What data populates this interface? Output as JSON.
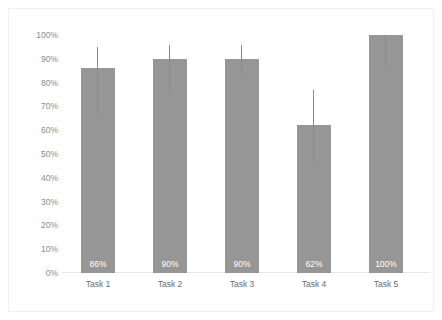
{
  "chart_data": {
    "type": "bar",
    "title": "",
    "subtitle": "",
    "xlabel": "",
    "ylabel": "",
    "categories": [
      "Task 1",
      "Task 2",
      "Task 3",
      "Task 4",
      "Task 5"
    ],
    "values": [
      86,
      90,
      90,
      62,
      100
    ],
    "value_labels": [
      "86%",
      "90%",
      "90%",
      "62%",
      "100%"
    ],
    "error_bars": [
      {
        "low": 67,
        "high": 95
      },
      {
        "low": 75,
        "high": 96
      },
      {
        "low": 84,
        "high": 96
      },
      {
        "low": 47,
        "high": 77
      },
      {
        "low": 87,
        "high": 100
      }
    ],
    "ylim": [
      0,
      100
    ],
    "ytick_values": [
      0,
      10,
      20,
      30,
      40,
      50,
      60,
      70,
      80,
      90,
      100
    ],
    "ytick_labels": [
      "0%",
      "10%",
      "20%",
      "30%",
      "40%",
      "50%",
      "60%",
      "70%",
      "80%",
      "90%",
      "100%"
    ],
    "grid": false,
    "legend": false,
    "legend_position": "none",
    "series": [
      {
        "name": "",
        "values": [
          86,
          90,
          90,
          62,
          100
        ]
      }
    ],
    "colors": {
      "bar": "#969696",
      "error_bar": "#8a8a8a",
      "data_label": "#ffffff",
      "tick_label": "#8c8c8c",
      "category_label": "#6e6e6e",
      "background": "#ffffff",
      "frame": "#f0f0f0",
      "baseline": "#e8e8e8"
    }
  }
}
